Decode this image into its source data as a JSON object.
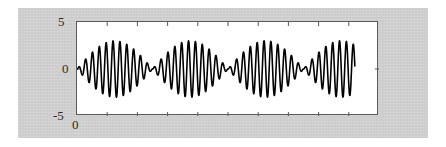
{
  "figure": {
    "background_color": "#d3d3d3",
    "axes_background": "#ffffff",
    "axes_border_color": "#5a5a5a",
    "line_color": "#000000"
  },
  "axis_labels": {
    "y_top": "5",
    "y_mid": "0",
    "y_bottom": "-5",
    "x_origin": "0"
  },
  "chart_data": {
    "type": "line",
    "title": "",
    "xlabel": "",
    "ylabel": "",
    "xlim": [
      0,
      1
    ],
    "ylim": [
      -5,
      5
    ],
    "grid": false,
    "legend": null,
    "y_ticks": [
      -5,
      0,
      5
    ],
    "y_tick_labels": [
      "-5",
      "0",
      "5"
    ],
    "x_ticks": [
      0
    ],
    "x_tick_labels": [
      "0"
    ],
    "x_minor_tick_count": 9,
    "series": [
      {
        "name": "modulated signal",
        "color": "#000000",
        "line_width": 1.6,
        "model": "y = A * sin(2*pi*f_env*t) * sin(2*pi*f_car*t)",
        "amplitude": 3.0,
        "carrier_cycles": 44,
        "envelope_cycles": 4,
        "t_start": 0.0,
        "t_end": 0.92,
        "peak_positive": 3.0,
        "peak_negative": -3.0,
        "packet_peaks": [
          3.0,
          3.0,
          3.0,
          3.0
        ],
        "node_count": 4
      }
    ]
  }
}
